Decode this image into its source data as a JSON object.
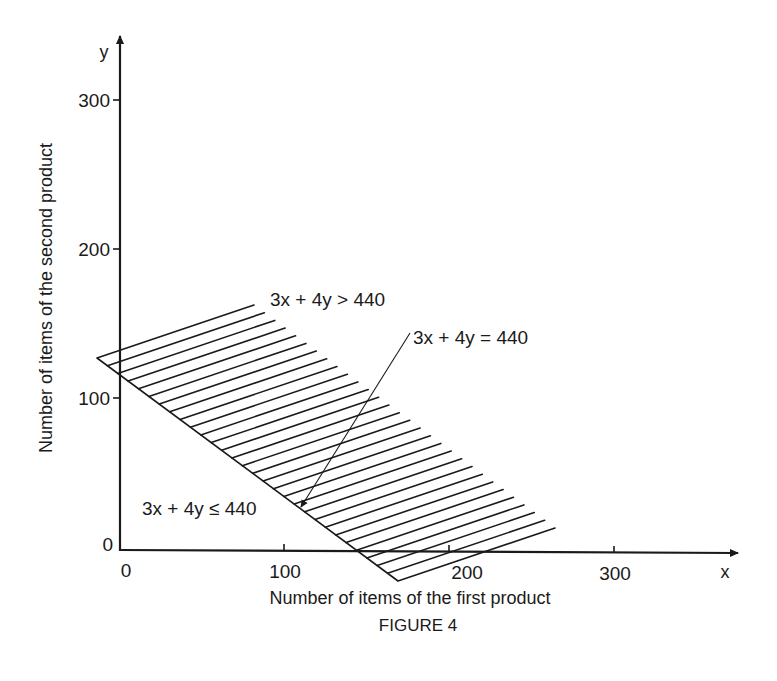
{
  "chart_data": {
    "type": "area",
    "title": "",
    "caption": "FIGURE 4",
    "xlabel": "Number of items of the first product",
    "ylabel": "Number of items of the second product",
    "x_axis_letter": "x",
    "y_axis_letter": "y",
    "xlim": [
      0,
      350
    ],
    "ylim": [
      0,
      320
    ],
    "x_ticks": [
      {
        "value": 0,
        "label": "0"
      },
      {
        "value": 100,
        "label": "100"
      },
      {
        "value": 200,
        "label": "200"
      },
      {
        "value": 300,
        "label": "300"
      }
    ],
    "y_ticks": [
      {
        "value": 0,
        "label": "0"
      },
      {
        "value": 100,
        "label": "100"
      },
      {
        "value": 200,
        "label": "200"
      },
      {
        "value": 300,
        "label": "300"
      }
    ],
    "grid": false,
    "boundary_line": {
      "equation": "3x + 4y = 440",
      "x_intercept": 146.67,
      "y_intercept": 110
    },
    "regions": [
      {
        "name": "feasible",
        "label": "3x + 4y ≤ 440",
        "side": "below line",
        "shaded": false
      },
      {
        "name": "infeasible",
        "label": "3x + 4y > 440",
        "side": "above line",
        "shaded": true,
        "pattern": "diagonal hatch"
      }
    ],
    "annotations": [
      {
        "text": "3x + 4y > 440",
        "target": "hatched region"
      },
      {
        "text": "3x + 4y = 440",
        "target": "boundary line",
        "arrow": true
      },
      {
        "text": "3x + 4y ≤ 440",
        "target": "region below boundary"
      }
    ]
  },
  "labels": {
    "gt": "3x + 4y > 440",
    "eq": "3x + 4y = 440",
    "le": "3x + 4y ≤ 440",
    "caption": "FIGURE 4",
    "xlabel": "Number of items of the first product",
    "ylabel": "Number of items of the second product",
    "x_letter": "x",
    "y_letter": "y",
    "origin_y": "0",
    "origin_x": "0",
    "xt100": "100",
    "xt200": "200",
    "xt300": "300",
    "yt100": "100",
    "yt200": "200",
    "yt300": "300"
  },
  "geometry": {
    "origin_px": [
      120,
      550
    ],
    "x_px_per_100": 165,
    "y_px_per_100": 149.5,
    "hatch": {
      "lower_start": [
        97,
        358
      ],
      "lower_end": [
        398,
        581
      ],
      "direction": [
        157,
        -53
      ],
      "count": 30,
      "upper_start": [
        254,
        305
      ],
      "upper_end": [
        555,
        528
      ]
    },
    "arrow": {
      "from": [
        410,
        333
      ],
      "to": [
        300,
        508
      ]
    }
  },
  "colors": {
    "ink": "#1a1a1a",
    "paper": "#ffffff"
  }
}
